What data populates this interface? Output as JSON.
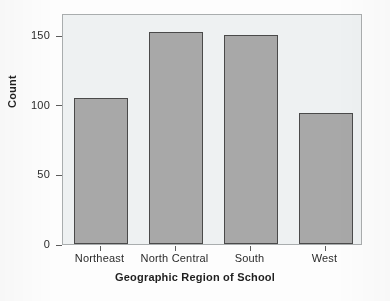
{
  "chart_data": {
    "type": "bar",
    "title": "",
    "xlabel": "Geographic Region of School",
    "ylabel": "Count",
    "categories": [
      "Northeast",
      "North Central",
      "South",
      "West"
    ],
    "values": [
      105,
      152,
      150,
      94
    ],
    "series": [
      {
        "name": "Count",
        "values": [
          105,
          152,
          150,
          94
        ]
      }
    ],
    "ylim": [
      0,
      166
    ],
    "yticks": [
      0,
      50,
      100,
      150
    ],
    "ytick_labels": [
      "0",
      "50",
      "100",
      "150"
    ],
    "grid": false,
    "legend": false,
    "bar_color": "#a8a8a8",
    "bar_edge_color": "#4a4a4a",
    "plot_background": "#eef1f2",
    "frame_color": "#a9adae",
    "text_color": "#2b2b2b"
  }
}
